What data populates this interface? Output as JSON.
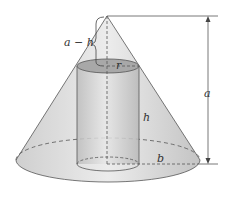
{
  "diagram": {
    "labels": {
      "a_minus_h": "a − h",
      "r": "r",
      "h": "h",
      "a": "a",
      "b": "b"
    },
    "colors": {
      "cone_fill": "#d9d9d9",
      "cylinder_fill": "#c8c8c8",
      "stroke": "#555555"
    }
  }
}
